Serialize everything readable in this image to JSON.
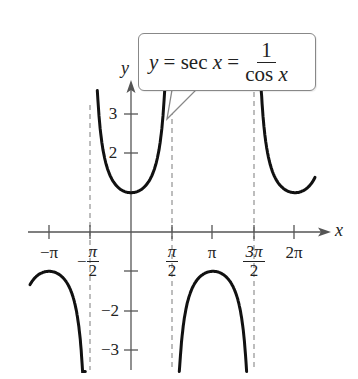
{
  "chart_data": {
    "type": "line",
    "title": "",
    "function": "y = sec x = 1/cos x",
    "annotation": {
      "text_left": "y = sec x =",
      "fraction_numerator": "1",
      "fraction_denominator": "cos x"
    },
    "xlabel": "x",
    "ylabel": "y",
    "x_ticks": [
      {
        "value": -3.14159,
        "label": "−π"
      },
      {
        "value": -1.5708,
        "label": "−π/2"
      },
      {
        "value": 1.5708,
        "label": "π/2"
      },
      {
        "value": 3.14159,
        "label": "π"
      },
      {
        "value": 4.71239,
        "label": "3π/2"
      },
      {
        "value": 6.28319,
        "label": "2π"
      }
    ],
    "y_ticks": [
      {
        "value": 3,
        "label": "3"
      },
      {
        "value": 2,
        "label": "2"
      },
      {
        "value": -1,
        "label": ""
      },
      {
        "value": -2,
        "label": "−2"
      },
      {
        "value": -3,
        "label": "−3"
      }
    ],
    "asymptotes": [
      -1.5708,
      1.5708,
      4.71239
    ],
    "xlim": [
      -3.9,
      7.1
    ],
    "ylim": [
      -3.5,
      3.7
    ],
    "series": [
      {
        "name": "sec x branch (-3.87, -π/2)",
        "x": [
          -3.87,
          -3.14159,
          -2.5,
          -2.0,
          -1.8,
          -1.75
        ],
        "y": [
          -1.35,
          -1.0,
          -1.25,
          -2.4,
          -4.4,
          -5.6
        ]
      },
      {
        "name": "sec x branch (-π/2, π/2)",
        "x": [
          -1.29,
          -1.0,
          -0.5,
          0,
          0.5,
          1.0,
          1.29
        ],
        "y": [
          3.6,
          1.85,
          1.14,
          1.0,
          1.14,
          1.85,
          3.6
        ]
      },
      {
        "name": "sec x branch (π/2, 3π/2)",
        "x": [
          1.85,
          2.2,
          2.6,
          3.14159,
          3.7,
          4.1,
          4.43
        ],
        "y": [
          -3.6,
          -1.7,
          -1.17,
          -1.0,
          -1.17,
          -1.7,
          -3.6
        ]
      },
      {
        "name": "sec x branch (3π/2, 7.05)",
        "x": [
          4.99,
          5.3,
          5.8,
          6.28319,
          6.7,
          7.05
        ],
        "y": [
          3.6,
          1.8,
          1.13,
          1.0,
          1.1,
          1.42
        ]
      }
    ],
    "grid": false,
    "legend": null
  },
  "labels": {
    "x_axis": "x",
    "y_axis": "y",
    "x_ticks": {
      "neg_pi": "−π",
      "neg_half_pi_num": "π",
      "neg_half_pi_den": "2",
      "neg_sign": "−",
      "half_pi_num": "π",
      "half_pi_den": "2",
      "pi": "π",
      "three_half_pi_num": "3π",
      "three_half_pi_den": "2",
      "two_pi": "2π"
    },
    "y_ticks": {
      "three": "3",
      "two": "2",
      "neg_two": "−2",
      "neg_three": "−3"
    },
    "callout": {
      "y": "y",
      "eq1": " = sec ",
      "x": "x",
      "eq2": " = ",
      "num": "1",
      "den": "cos x"
    }
  },
  "style": {
    "curve_color": "#111111",
    "axis_color": "#555555",
    "asymptote_color": "#777777"
  }
}
